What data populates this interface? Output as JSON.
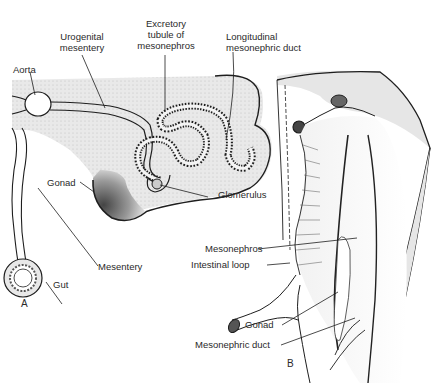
{
  "figure": {
    "panels": [
      {
        "id": "A",
        "label": "A",
        "description": "Transverse section through mesonephros"
      },
      {
        "id": "B",
        "label": "B",
        "description": "Ventral view of mesonephros and gonad"
      }
    ],
    "labels_a": {
      "aorta": "Aorta",
      "urogenital_mesentery_1": "Urogenital",
      "urogenital_mesentery_2": "mesentery",
      "excretory_1": "Excretory",
      "excretory_2": "tubule of",
      "excretory_3": "mesonephros",
      "longitudinal_1": "Longitudinal",
      "longitudinal_2": "mesonephric duct",
      "gonad": "Gonad",
      "glomerulus": "Glomerulus",
      "mesentery": "Mesentery",
      "gut": "Gut"
    },
    "labels_b": {
      "mesonephros": "Mesonephros",
      "intestinal_loop": "Intestinal loop",
      "gonad": "Gonad",
      "mesonephric_duct": "Mesonephric duct"
    },
    "colors": {
      "tissue_fill": "#e6e6e6",
      "line": "#1e1e1e",
      "gonad_dark": "#555555"
    }
  }
}
